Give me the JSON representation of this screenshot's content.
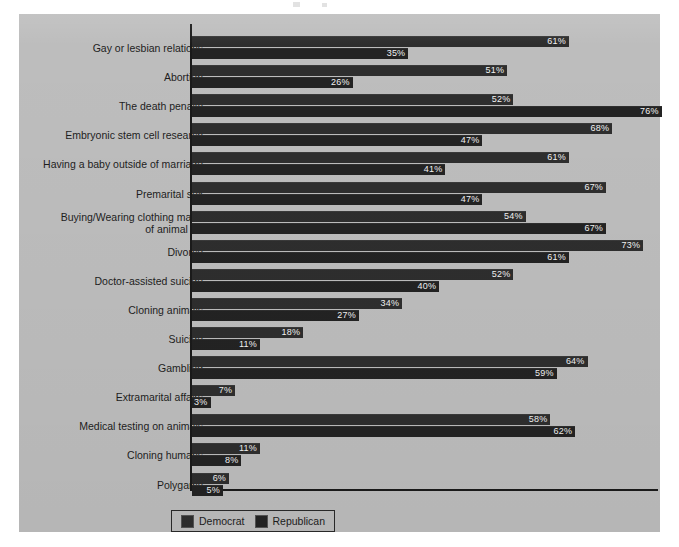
{
  "chart_data": {
    "type": "bar",
    "orientation": "horizontal",
    "title": "",
    "subtitle": "",
    "xlabel": "",
    "ylabel": "",
    "xlim": [
      0,
      80
    ],
    "grid": false,
    "legend_position": "bottom-left",
    "value_suffix": "%",
    "categories": [
      "Gay or lesbian relations",
      "Abortion",
      "The death penalty",
      "Embryonic stem cell research",
      "Having a baby outside of marriage",
      "Premarital sex",
      "Buying/Wearing clothing made\nof animal fur",
      "Divorce",
      "Doctor-assisted suicide",
      "Cloning animals",
      "Suicide",
      "Gambling",
      "Extramarital affairs",
      "Medical testing on animals",
      "Cloning humans",
      "Polygamy"
    ],
    "series": [
      {
        "name": "Democrat",
        "color": "#2e2e2e",
        "values": [
          61,
          51,
          52,
          68,
          61,
          67,
          54,
          73,
          52,
          34,
          18,
          64,
          7,
          58,
          11,
          6
        ],
        "labels": [
          "61%",
          "51%",
          "52%",
          "68%",
          "61%",
          "67%",
          "54%",
          "73%",
          "52%",
          "34%",
          "18%",
          "64%",
          "7%",
          "58%",
          "11%",
          "6%"
        ]
      },
      {
        "name": "Republican",
        "color": "#232323",
        "values": [
          35,
          26,
          76,
          47,
          41,
          47,
          67,
          61,
          40,
          27,
          11,
          59,
          3,
          62,
          8,
          5
        ],
        "labels": [
          "35%",
          "26%",
          "76%",
          "47%",
          "41%",
          "47%",
          "67%",
          "61%",
          "40%",
          "27%",
          "11%",
          "59%",
          "3%",
          "62%",
          "8%",
          "5%"
        ]
      }
    ]
  },
  "legend": {
    "items": [
      {
        "label": "Democrat",
        "swatch": "dem"
      },
      {
        "label": "Republican",
        "swatch": "rep"
      }
    ]
  },
  "colors": {
    "panel_background": "#bdbdbd",
    "page_background": "#ffffff",
    "axis": "#1a1a1a",
    "democrat_bar": "#2e2e2e",
    "republican_bar": "#232323",
    "value_text": "#f2f2f2",
    "label_text": "#1e1e1e"
  }
}
